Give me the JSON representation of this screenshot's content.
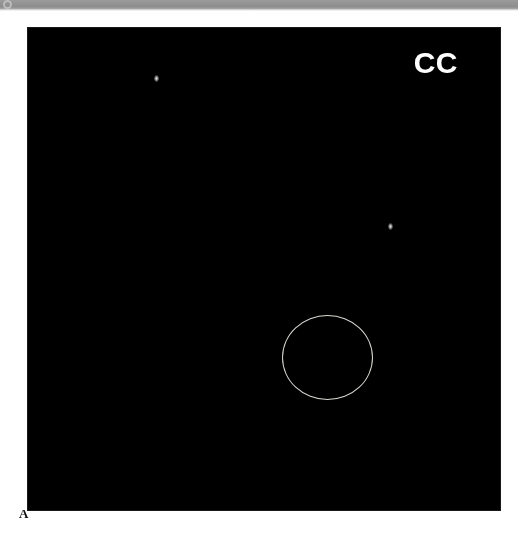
{
  "figure": {
    "panel_label": "A",
    "view_label": "CC",
    "modality": "mammogram"
  },
  "scan_bar": {
    "mark_icon": "circle-icon",
    "color": "#939393"
  },
  "plate": {
    "background_color": "#070707",
    "annotation_color": "#f6f6f0",
    "label_color": "#ffffff"
  },
  "annotations": {
    "lesion_circle": {
      "name": "lesion-circle",
      "center_x": 327,
      "center_y": 357,
      "radius_x": 45,
      "radius_y": 42
    },
    "markers": [
      {
        "name": "calcification-marker-upper",
        "x": 156,
        "y": 78
      },
      {
        "name": "calcification-marker-right",
        "x": 390,
        "y": 226
      }
    ]
  },
  "image_field": {
    "left": 28,
    "top": 28,
    "width": 472,
    "height": 482
  }
}
